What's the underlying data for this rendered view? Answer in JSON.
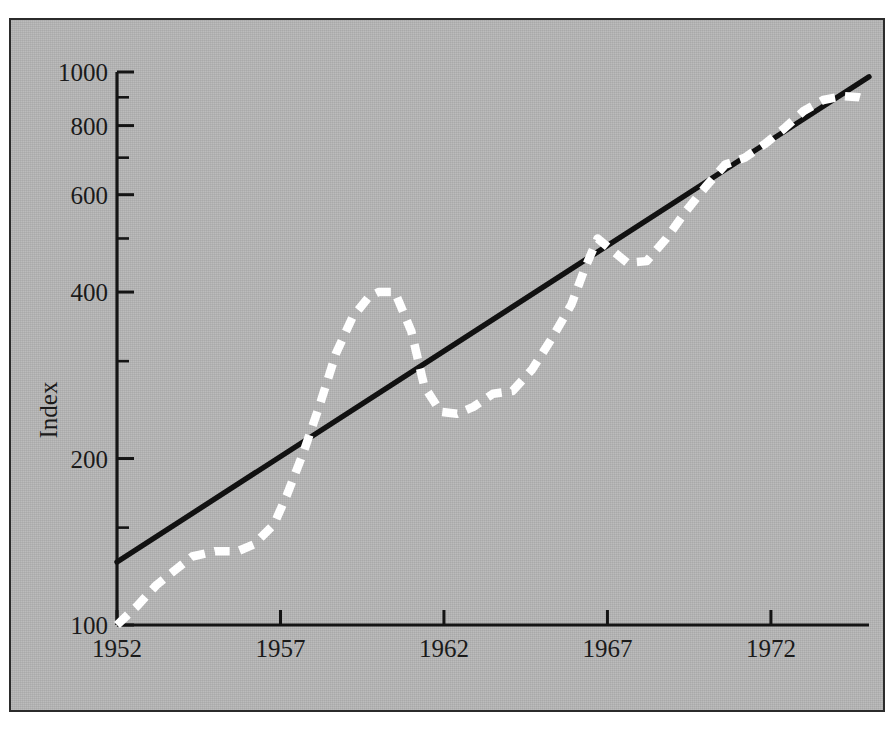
{
  "chart_data": {
    "type": "line",
    "title": "",
    "subtitle": "",
    "xlabel": "",
    "ylabel": "Index",
    "yscale": "log",
    "ylim": [
      100,
      1000
    ],
    "xlim": [
      1952,
      1975
    ],
    "grid": false,
    "legend": null,
    "yticks": [
      100,
      200,
      400,
      600,
      800,
      1000
    ],
    "ytick_labels": [
      "100",
      "200",
      "400",
      "600",
      "800",
      "1000"
    ],
    "yminor_ticks": [
      150,
      300,
      500,
      700,
      900
    ],
    "xticks": [
      1952,
      1957,
      1962,
      1967,
      1972
    ],
    "xtick_labels": [
      "1952",
      "1957",
      "1962",
      "1967",
      "1972"
    ],
    "background_color": "#b6b6b6",
    "border_color": "#2b2b2b",
    "series": [
      {
        "name": "trend-line",
        "style": "solid",
        "color": "#111111",
        "x": [
          1952,
          1975
        ],
        "values": [
          130,
          980
        ]
      },
      {
        "name": "index-series",
        "style": "dashed",
        "color": "#ffffff",
        "x": [
          1952,
          1952.6,
          1953.2,
          1953.8,
          1954.3,
          1955.0,
          1955.7,
          1956.2,
          1956.8,
          1957.2,
          1957.7,
          1958.2,
          1958.7,
          1959.2,
          1959.7,
          1960.0,
          1960.5,
          1961.0,
          1961.4,
          1961.9,
          1962.4,
          1962.9,
          1963.5,
          1964.1,
          1964.7,
          1965.3,
          1965.9,
          1966.3,
          1966.7,
          1967.1,
          1967.6,
          1968.2,
          1968.8,
          1969.4,
          1970.0,
          1970.6,
          1971.2,
          1971.8,
          1972.4,
          1973.0,
          1973.6,
          1974.2,
          1974.7,
          1975.0
        ],
        "values": [
          100,
          108,
          118,
          126,
          133,
          136,
          136,
          140,
          152,
          172,
          205,
          250,
          310,
          360,
          392,
          400,
          400,
          340,
          270,
          243,
          241,
          248,
          262,
          265,
          290,
          330,
          380,
          440,
          500,
          478,
          452,
          455,
          500,
          560,
          620,
          680,
          700,
          740,
          790,
          850,
          890,
          905,
          900,
          890
        ]
      }
    ],
    "annotations": []
  },
  "axis": {
    "y_label_text": "Index"
  }
}
